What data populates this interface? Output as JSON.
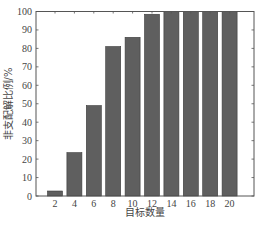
{
  "chart_data": {
    "type": "bar",
    "title": "",
    "xlabel": "目标数量",
    "ylabel": "非支配解比例/%",
    "categories": [
      "2",
      "4",
      "6",
      "8",
      "10",
      "12",
      "14",
      "16",
      "18",
      "20"
    ],
    "values": [
      2.7,
      23.5,
      49,
      81,
      86,
      98.5,
      100,
      100,
      100,
      100
    ],
    "ylim": [
      0,
      100
    ],
    "yticks": [
      0,
      10,
      20,
      30,
      40,
      50,
      60,
      70,
      80,
      90,
      100
    ],
    "grid": false,
    "legend": null,
    "bar_color": "#5f5f5f"
  }
}
